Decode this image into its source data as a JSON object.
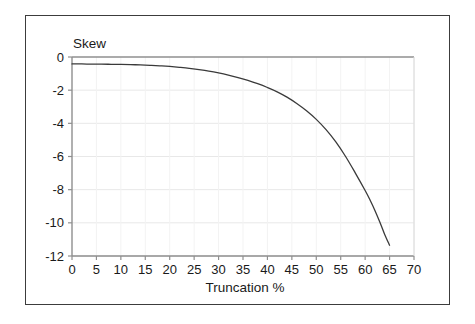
{
  "chart_data": {
    "type": "line",
    "title": "",
    "xlabel": "Truncation %",
    "ylabel": "Skew",
    "xlim": [
      0,
      70
    ],
    "ylim": [
      -12,
      0
    ],
    "xticks": [
      0,
      5,
      10,
      15,
      20,
      25,
      30,
      35,
      40,
      45,
      50,
      55,
      60,
      65,
      70
    ],
    "yticks": [
      0,
      -2,
      -4,
      -6,
      -8,
      -10,
      -12
    ],
    "xtick_labels": [
      "0",
      "5",
      "10",
      "15",
      "20",
      "25",
      "30",
      "35",
      "40",
      "45",
      "50",
      "55",
      "60",
      "65",
      "70"
    ],
    "ytick_labels": [
      "0",
      "-2",
      "-4",
      "-6",
      "-8",
      "-10",
      "-12"
    ],
    "grid": true,
    "grid_axis": "y",
    "legend": false,
    "legend_position": "none",
    "line_color": "#3a3a3a",
    "grid_color": "#e8e8e8",
    "axis_color": "#9a9a9a",
    "frame_color": "#3c3c3c",
    "background": "#ffffff",
    "series": [
      {
        "name": "Skew",
        "x": [
          0,
          2,
          4,
          6,
          8,
          10,
          12,
          14,
          16,
          18,
          20,
          22,
          24,
          26,
          28,
          30,
          32,
          34,
          36,
          38,
          40,
          42,
          44,
          46,
          48,
          50,
          52,
          54,
          56,
          58,
          60,
          61,
          62,
          63,
          64,
          65
        ],
        "values": [
          -0.42,
          -0.42,
          -0.43,
          -0.43,
          -0.44,
          -0.45,
          -0.46,
          -0.48,
          -0.5,
          -0.53,
          -0.57,
          -0.62,
          -0.68,
          -0.76,
          -0.85,
          -0.96,
          -1.09,
          -1.24,
          -1.41,
          -1.61,
          -1.84,
          -2.1,
          -2.42,
          -2.8,
          -3.24,
          -3.76,
          -4.38,
          -5.12,
          -6.0,
          -7.0,
          -8.05,
          -8.62,
          -9.25,
          -9.95,
          -10.7,
          -11.35
        ]
      }
    ]
  },
  "axis_labels": {
    "y_title": "Skew",
    "x_title": "Truncation %"
  }
}
